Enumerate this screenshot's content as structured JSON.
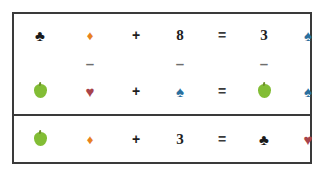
{
  "puzzle": {
    "title": "Symbol Equation Puzzle",
    "colors": {
      "club_black": "#1a1a1a",
      "diamond_orange": "#e8821e",
      "spade_blue": "#2a6f9e",
      "heart_red": "#a8434b",
      "apple_green": "#82bd35",
      "apple_stem": "#6d8f2a",
      "frame": "#3a3a3a",
      "text": "#1e1e1e",
      "minus": "#6e6e6e",
      "background": "#ffffff"
    },
    "sections": [
      {
        "name": "top",
        "rows": [
          {
            "name": "equation-row-1",
            "cells": [
              {
                "kind": "icon",
                "icon": "club-icon",
                "glyph": "♣",
                "color": "#1a1a1a",
                "size": "suit"
              },
              {
                "kind": "icon",
                "icon": "diamond-icon",
                "glyph": "♦",
                "color": "#e8821e",
                "size": "suit-sm"
              },
              {
                "kind": "operator",
                "text": "+"
              },
              {
                "kind": "number",
                "text": "8"
              },
              {
                "kind": "operator-equals",
                "text": "="
              },
              {
                "kind": "number",
                "text": "3"
              },
              {
                "kind": "icon",
                "icon": "spade-icon",
                "glyph": "♠",
                "color": "#2a6f9e",
                "size": "suit"
              }
            ]
          },
          {
            "name": "operator-row-minus",
            "cells": [
              {
                "kind": "blank",
                "text": ""
              },
              {
                "kind": "minus",
                "text": "–"
              },
              {
                "kind": "blank",
                "text": ""
              },
              {
                "kind": "minus",
                "text": "–"
              },
              {
                "kind": "blank",
                "text": ""
              },
              {
                "kind": "minus",
                "text": "–"
              },
              {
                "kind": "blank",
                "text": ""
              }
            ]
          },
          {
            "name": "equation-row-2",
            "cells": [
              {
                "kind": "apple",
                "icon": "green-apple-icon",
                "color": "#82bd35",
                "stem": "#6d8f2a"
              },
              {
                "kind": "icon",
                "icon": "heart-icon",
                "glyph": "♥",
                "color": "#a8434b",
                "size": "suit"
              },
              {
                "kind": "operator",
                "text": "+"
              },
              {
                "kind": "icon",
                "icon": "spade-icon",
                "glyph": "♠",
                "color": "#2a6f9e",
                "size": "suit"
              },
              {
                "kind": "operator-equals",
                "text": "="
              },
              {
                "kind": "apple",
                "icon": "green-apple-icon",
                "color": "#82bd35",
                "stem": "#6d8f2a"
              },
              {
                "kind": "icon",
                "icon": "spade-icon",
                "glyph": "♠",
                "color": "#2a6f9e",
                "size": "suit"
              }
            ]
          }
        ]
      },
      {
        "name": "bottom",
        "rows": [
          {
            "name": "equation-row-3",
            "cells": [
              {
                "kind": "apple",
                "icon": "green-apple-icon",
                "color": "#82bd35",
                "stem": "#6d8f2a"
              },
              {
                "kind": "icon",
                "icon": "diamond-icon",
                "glyph": "♦",
                "color": "#e8821e",
                "size": "suit-sm"
              },
              {
                "kind": "operator",
                "text": "+"
              },
              {
                "kind": "number",
                "text": "3"
              },
              {
                "kind": "operator-equals",
                "text": "="
              },
              {
                "kind": "icon",
                "icon": "club-icon",
                "glyph": "♣",
                "color": "#1a1a1a",
                "size": "suit"
              },
              {
                "kind": "icon",
                "icon": "heart-icon",
                "glyph": "♥",
                "color": "#a8434b",
                "size": "suit"
              }
            ]
          }
        ]
      }
    ]
  }
}
